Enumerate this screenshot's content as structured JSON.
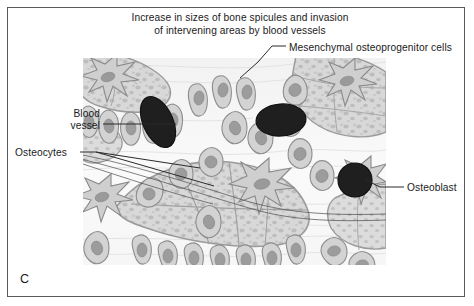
{
  "figure": {
    "panel_letter": "C",
    "title_lines": [
      "Increase in sizes of bone spicules and invasion",
      "of intervening areas by blood vessels"
    ],
    "border_color": "#5a5a5a",
    "background_color": "#ffffff"
  },
  "labels": {
    "mesenchymal": "Mesenchymal osteoprogenitor cells",
    "blood_vessel": "Blood vessel",
    "osteocytes": "Osteocytes",
    "osteoblast": "Osteoblast"
  },
  "illustration": {
    "description": "Histological drawing of developing bone: bone spicules with embedded osteocytes, lined by osteoblasts, with blood vessels invading the intervening areas",
    "colors": {
      "spicule_matrix": "#d2d2d2",
      "spicule_stipple": "#b9b9b9",
      "cell_body": "#cfcfcf",
      "cell_outline": "#8a8a8a",
      "nucleus": "#9a9a9a",
      "blood_vessel": "#201f1f",
      "background_tissue": "#f4f4f4",
      "fiber_line": "#bdbdbd"
    },
    "blood_vessels": [
      {
        "cx": 75,
        "cy": 64,
        "rx": 16,
        "ry": 27,
        "rotate": -24
      },
      {
        "cx": 198,
        "cy": 62,
        "rx": 25,
        "ry": 16,
        "rotate": -4
      },
      {
        "cx": 272,
        "cy": 122,
        "rx": 17,
        "ry": 17,
        "rotate": 0
      }
    ]
  }
}
